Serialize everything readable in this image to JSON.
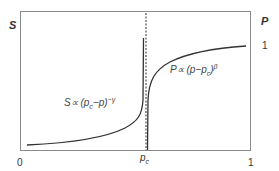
{
  "diagram": {
    "type": "phase-transition-plot",
    "left_axis_label": "S",
    "right_axis_label": "P",
    "right_axis_tick": "1",
    "x_ticks": {
      "left": "0",
      "critical": "p",
      "critical_sub": "c",
      "right": "1"
    },
    "formulas": {
      "S": {
        "prefix": "S∝ (p",
        "sub": "c",
        "mid": "−p)",
        "sup": "−γ"
      },
      "P": {
        "prefix": "P∝ (p−p",
        "sub": "c",
        "mid": ")",
        "sup": "β"
      }
    },
    "colors": {
      "frame": "#888888",
      "curve": "#333333",
      "dashed": "#555555",
      "text": "#333333"
    }
  }
}
